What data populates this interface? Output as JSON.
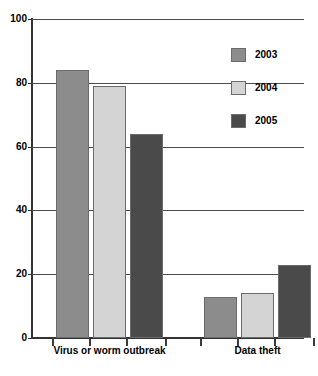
{
  "chart_data": {
    "type": "bar",
    "title": "",
    "subtitle": "",
    "xlabel": "",
    "ylabel": "",
    "categories": [
      "Virus or worm outbreak",
      "Data theft"
    ],
    "series": [
      {
        "name": "2003",
        "color": "#8c8c8c",
        "values": [
          84,
          13
        ]
      },
      {
        "name": "2004",
        "color": "#d4d4d4",
        "values": [
          79,
          14
        ]
      },
      {
        "name": "2005",
        "color": "#4a4a4a",
        "values": [
          64,
          23
        ]
      }
    ],
    "ylim": [
      0,
      100
    ],
    "yticks": [
      0,
      20,
      40,
      60,
      80,
      100
    ],
    "ytick_labels": [
      "0",
      "20",
      "40",
      "60",
      "80",
      "100"
    ],
    "grid": true,
    "legend_position": "top-right",
    "annotations": []
  }
}
